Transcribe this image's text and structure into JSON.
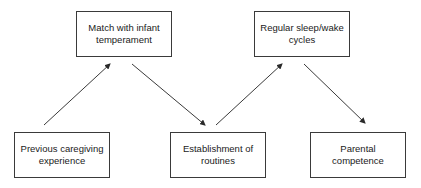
{
  "diagram": {
    "type": "flow",
    "nodes": [
      {
        "id": "match",
        "label": "Match with infant\ntemperament",
        "x": 76,
        "y": 11
      },
      {
        "id": "sleep",
        "label": "Regular sleep/wake\ncycles",
        "x": 254,
        "y": 11
      },
      {
        "id": "previous",
        "label": "Previous caregiving\nexperience",
        "x": 14,
        "y": 132
      },
      {
        "id": "routines",
        "label": "Establishment of\nroutines",
        "x": 170,
        "y": 132
      },
      {
        "id": "competence",
        "label": "Parental\ncompetence",
        "x": 310,
        "y": 132
      }
    ],
    "edges": [
      {
        "from": "previous",
        "to": "match",
        "x1": 44,
        "y1": 125,
        "x2": 110,
        "y2": 64
      },
      {
        "from": "match",
        "to": "routines",
        "x1": 132,
        "y1": 64,
        "x2": 205,
        "y2": 125
      },
      {
        "from": "routines",
        "to": "sleep",
        "x1": 216,
        "y1": 125,
        "x2": 282,
        "y2": 64
      },
      {
        "from": "sleep",
        "to": "competence",
        "x1": 304,
        "y1": 64,
        "x2": 365,
        "y2": 123
      }
    ],
    "colors": {
      "stroke": "#3a3a3a",
      "text": "#1a1a1a",
      "background": "#ffffff"
    }
  }
}
